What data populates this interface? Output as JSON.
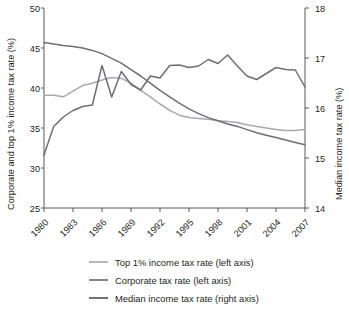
{
  "chart_data": {
    "type": "line",
    "title": "",
    "xlabel": "",
    "ylabel": "Corporate and top 1% income tax rate (%)",
    "y2label": "Median income tax rate (%)",
    "x": [
      1980,
      1981,
      1982,
      1983,
      1984,
      1985,
      1986,
      1987,
      1988,
      1989,
      1990,
      1991,
      1992,
      1993,
      1994,
      1995,
      1996,
      1997,
      1998,
      1999,
      2000,
      2001,
      2002,
      2003,
      2004,
      2005,
      2006,
      2007
    ],
    "xticks": [
      1980,
      1983,
      1986,
      1989,
      1992,
      1995,
      1998,
      2001,
      2004,
      2007
    ],
    "xlim": [
      1980,
      2007
    ],
    "ylim": [
      25,
      50
    ],
    "yticks": [
      25,
      30,
      35,
      40,
      45,
      50
    ],
    "y2lim": [
      14,
      18
    ],
    "y2ticks": [
      14,
      15,
      16,
      17,
      18
    ],
    "grid": false,
    "legend_position": "bottom",
    "series": [
      {
        "name": "Top 1% income tax rate (left axis)",
        "axis": "left",
        "color": "#a7a9ac",
        "values": [
          39.1,
          39.1,
          38.9,
          39.6,
          40.3,
          40.6,
          41.0,
          41.3,
          41.2,
          40.6,
          39.7,
          38.9,
          38.0,
          37.2,
          36.6,
          36.3,
          36.2,
          36.1,
          35.9,
          35.8,
          35.7,
          35.4,
          35.2,
          35.0,
          34.8,
          34.7,
          34.7,
          34.8
        ]
      },
      {
        "name": "Corporate tax rate (left axis)",
        "axis": "left",
        "color": "#6d6e71",
        "values": [
          45.7,
          45.5,
          45.3,
          45.2,
          45.0,
          44.7,
          44.3,
          43.7,
          43.1,
          42.3,
          41.5,
          40.6,
          39.7,
          38.9,
          38.1,
          37.4,
          36.8,
          36.3,
          35.9,
          35.5,
          35.2,
          34.8,
          34.4,
          34.1,
          33.8,
          33.5,
          33.2,
          32.9
        ]
      },
      {
        "name": "Median income tax rate (right axis)",
        "axis": "right",
        "color": "#6d6e71",
        "values": [
          15.06,
          15.63,
          15.82,
          15.95,
          16.03,
          16.06,
          16.85,
          16.22,
          16.73,
          16.47,
          16.36,
          16.64,
          16.6,
          16.85,
          16.86,
          16.81,
          16.84,
          16.97,
          16.89,
          17.06,
          16.84,
          16.64,
          16.57,
          16.69,
          16.81,
          16.77,
          16.76,
          16.42
        ]
      }
    ]
  },
  "legend": {
    "entries": [
      {
        "label": "Top 1% income tax rate (left axis)",
        "color": "#a7a9ac"
      },
      {
        "label": "Corporate tax rate (left axis)",
        "color": "#6d6e71"
      },
      {
        "label": "Median income tax rate (right axis)",
        "color": "#58595b"
      }
    ]
  },
  "axes": {
    "left_title": "Corporate and top 1% income tax rate (%)",
    "right_title": "Median income tax rate (%)",
    "left_ticks": [
      "50",
      "45",
      "40",
      "35",
      "30",
      "25"
    ],
    "right_ticks": [
      "18",
      "17",
      "16",
      "15",
      "14"
    ],
    "x_ticks": [
      "1980",
      "1983",
      "1986",
      "1989",
      "1992",
      "1995",
      "1998",
      "2001",
      "2004",
      "2007"
    ]
  }
}
